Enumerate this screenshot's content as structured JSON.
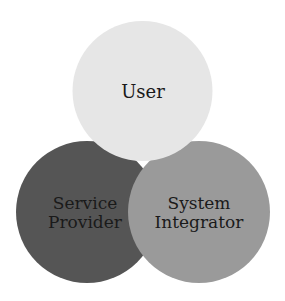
{
  "diagram": {
    "type": "venn",
    "circles": [
      {
        "id": "user",
        "lines": [
          "User"
        ],
        "color": "#e6e6e6"
      },
      {
        "id": "service-provider",
        "lines": [
          "Service",
          "Provider"
        ],
        "color": "#555555"
      },
      {
        "id": "system-integrator",
        "lines": [
          "System",
          "Integrator"
        ],
        "color": "#9a9a9a"
      }
    ],
    "background": "#ffffff",
    "text_color": "#1a1a1a"
  }
}
